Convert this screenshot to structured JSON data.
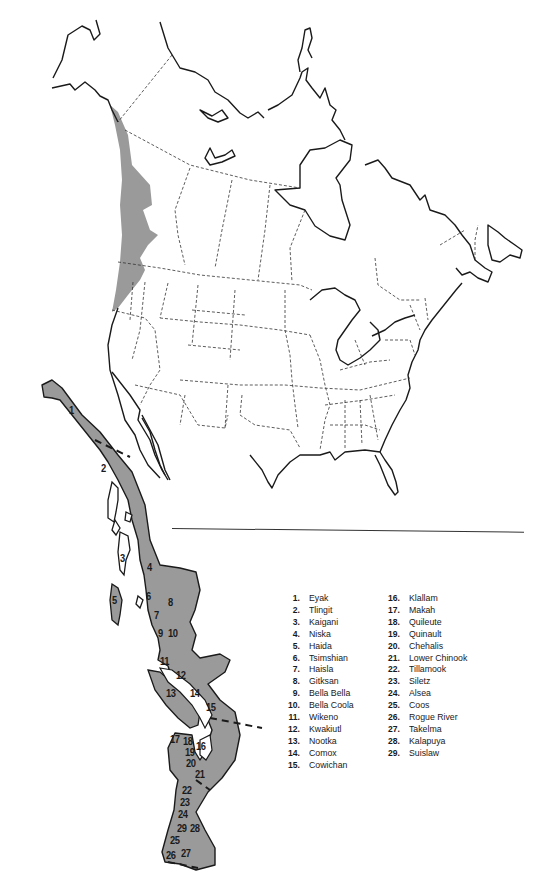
{
  "map": {
    "title": "Northwest Coast culture area",
    "shading_color": "#9a9a9a",
    "inset_labels": [
      {
        "id": "1",
        "x": 70,
        "y": 412
      },
      {
        "id": "2",
        "x": 102,
        "y": 466
      },
      {
        "id": "3",
        "x": 121,
        "y": 556
      },
      {
        "id": "4",
        "x": 147,
        "y": 565
      },
      {
        "id": "5",
        "x": 113,
        "y": 598
      },
      {
        "id": "6",
        "x": 146,
        "y": 594
      },
      {
        "id": "7",
        "x": 154,
        "y": 613
      },
      {
        "id": "8",
        "x": 169,
        "y": 600
      },
      {
        "id": "9",
        "x": 159,
        "y": 630
      },
      {
        "id": "10",
        "x": 170,
        "y": 630
      },
      {
        "id": "11",
        "x": 162,
        "y": 658
      },
      {
        "id": "12",
        "x": 177,
        "y": 672
      },
      {
        "id": "13",
        "x": 167,
        "y": 690
      },
      {
        "id": "14",
        "x": 190,
        "y": 690
      },
      {
        "id": "15",
        "x": 206,
        "y": 703
      },
      {
        "id": "16",
        "x": 196,
        "y": 743
      },
      {
        "id": "17",
        "x": 170,
        "y": 735
      },
      {
        "id": "18",
        "x": 183,
        "y": 738
      },
      {
        "id": "19",
        "x": 185,
        "y": 749
      },
      {
        "id": "20",
        "x": 186,
        "y": 760
      },
      {
        "id": "21",
        "x": 195,
        "y": 771
      },
      {
        "id": "22",
        "x": 182,
        "y": 786
      },
      {
        "id": "23",
        "x": 179,
        "y": 798
      },
      {
        "id": "24",
        "x": 177,
        "y": 810
      },
      {
        "id": "25",
        "x": 170,
        "y": 836
      },
      {
        "id": "26",
        "x": 166,
        "y": 851
      },
      {
        "id": "27",
        "x": 181,
        "y": 849
      },
      {
        "id": "28",
        "x": 189,
        "y": 824
      },
      {
        "id": "29",
        "x": 176,
        "y": 824
      }
    ]
  },
  "legend": {
    "column1": [
      {
        "num": "1.",
        "name": "Eyak"
      },
      {
        "num": "2.",
        "name": "Tlingit"
      },
      {
        "num": "3.",
        "name": "Kaigani"
      },
      {
        "num": "4.",
        "name": "Niska"
      },
      {
        "num": "5.",
        "name": "Haida"
      },
      {
        "num": "6.",
        "name": "Tsimshian"
      },
      {
        "num": "7.",
        "name": "Haisla"
      },
      {
        "num": "8.",
        "name": "Gitksan"
      },
      {
        "num": "9.",
        "name": "Bella Bella"
      },
      {
        "num": "10.",
        "name": "Bella Coola"
      },
      {
        "num": "11.",
        "name": "Wikeno"
      },
      {
        "num": "12.",
        "name": "Kwakiutl"
      },
      {
        "num": "13.",
        "name": "Nootka"
      },
      {
        "num": "14.",
        "name": "Comox"
      },
      {
        "num": "15.",
        "name": "Cowichan"
      }
    ],
    "column2": [
      {
        "num": "16.",
        "name": "Klallam"
      },
      {
        "num": "17.",
        "name": "Makah"
      },
      {
        "num": "18.",
        "name": "Quileute"
      },
      {
        "num": "19.",
        "name": "Quinault"
      },
      {
        "num": "20.",
        "name": "Chehalis"
      },
      {
        "num": "21.",
        "name": "Lower Chinook"
      },
      {
        "num": "22.",
        "name": "Tillamook"
      },
      {
        "num": "23.",
        "name": "Siletz"
      },
      {
        "num": "24.",
        "name": "Alsea"
      },
      {
        "num": "25.",
        "name": "Coos"
      },
      {
        "num": "26.",
        "name": "Rogue River"
      },
      {
        "num": "27.",
        "name": "Takelma"
      },
      {
        "num": "28.",
        "name": "Kalapuya"
      },
      {
        "num": "29.",
        "name": "Suislaw"
      }
    ]
  }
}
